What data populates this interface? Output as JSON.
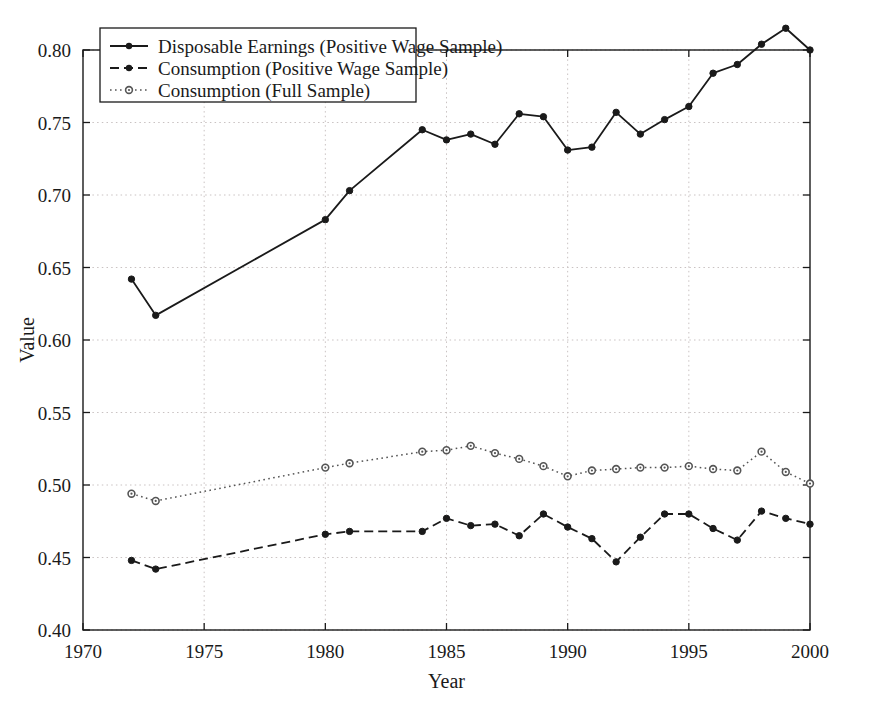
{
  "chart_data": {
    "type": "line",
    "title": "",
    "xlabel": "Year",
    "ylabel": "Value",
    "xlim": [
      1970,
      2000
    ],
    "ylim": [
      0.4,
      0.8
    ],
    "grid": true,
    "legend_position": "top-left",
    "x_ticks": [
      "1970",
      "1975",
      "1980",
      "1985",
      "1990",
      "1995",
      "2000"
    ],
    "x_tick_values": [
      1970,
      1975,
      1980,
      1985,
      1990,
      1995,
      2000
    ],
    "y_ticks": [
      "0.40",
      "0.45",
      "0.50",
      "0.55",
      "0.60",
      "0.65",
      "0.70",
      "0.75",
      "0.80"
    ],
    "y_tick_values": [
      0.4,
      0.45,
      0.5,
      0.55,
      0.6,
      0.65,
      0.7,
      0.75,
      0.8
    ],
    "series": [
      {
        "name": "Disposable Earnings (Positive Wage Sample)",
        "style": "solid",
        "marker": "filled-circle",
        "color": "#1a1a1a",
        "x": [
          1972,
          1973,
          1980,
          1981,
          1984,
          1985,
          1986,
          1987,
          1988,
          1989,
          1990,
          1991,
          1992,
          1993,
          1994,
          1995,
          1996,
          1997,
          1998,
          1999,
          2000
        ],
        "values": [
          0.642,
          0.617,
          0.683,
          0.703,
          0.745,
          0.738,
          0.742,
          0.735,
          0.756,
          0.754,
          0.731,
          0.733,
          0.757,
          0.742,
          0.752,
          0.761,
          0.784,
          0.79,
          0.804,
          0.815,
          0.8
        ]
      },
      {
        "name": "Consumption (Positive Wage Sample)",
        "style": "dashed",
        "marker": "filled-circle",
        "color": "#1a1a1a",
        "x": [
          1972,
          1973,
          1980,
          1981,
          1984,
          1985,
          1986,
          1987,
          1988,
          1989,
          1990,
          1991,
          1992,
          1993,
          1994,
          1995,
          1996,
          1997,
          1998,
          1999,
          2000
        ],
        "values": [
          0.448,
          0.442,
          0.466,
          0.468,
          0.468,
          0.477,
          0.472,
          0.473,
          0.465,
          0.48,
          0.471,
          0.463,
          0.447,
          0.464,
          0.48,
          0.48,
          0.47,
          0.462,
          0.482,
          0.477,
          0.473
        ]
      },
      {
        "name": "Consumption (Full Sample)",
        "style": "dotted",
        "marker": "open-circle",
        "color": "#555555",
        "x": [
          1972,
          1973,
          1980,
          1981,
          1984,
          1985,
          1986,
          1987,
          1988,
          1989,
          1990,
          1991,
          1992,
          1993,
          1994,
          1995,
          1996,
          1997,
          1998,
          1999,
          2000
        ],
        "values": [
          0.494,
          0.489,
          0.512,
          0.515,
          0.523,
          0.524,
          0.527,
          0.522,
          0.518,
          0.513,
          0.506,
          0.51,
          0.511,
          0.512,
          0.512,
          0.513,
          0.511,
          0.51,
          0.523,
          0.509,
          0.501
        ]
      }
    ]
  },
  "legend": {
    "items": [
      {
        "label": "Disposable Earnings (Positive Wage Sample)"
      },
      {
        "label": "Consumption (Positive Wage Sample)"
      },
      {
        "label": "Consumption (Full Sample)"
      }
    ]
  }
}
